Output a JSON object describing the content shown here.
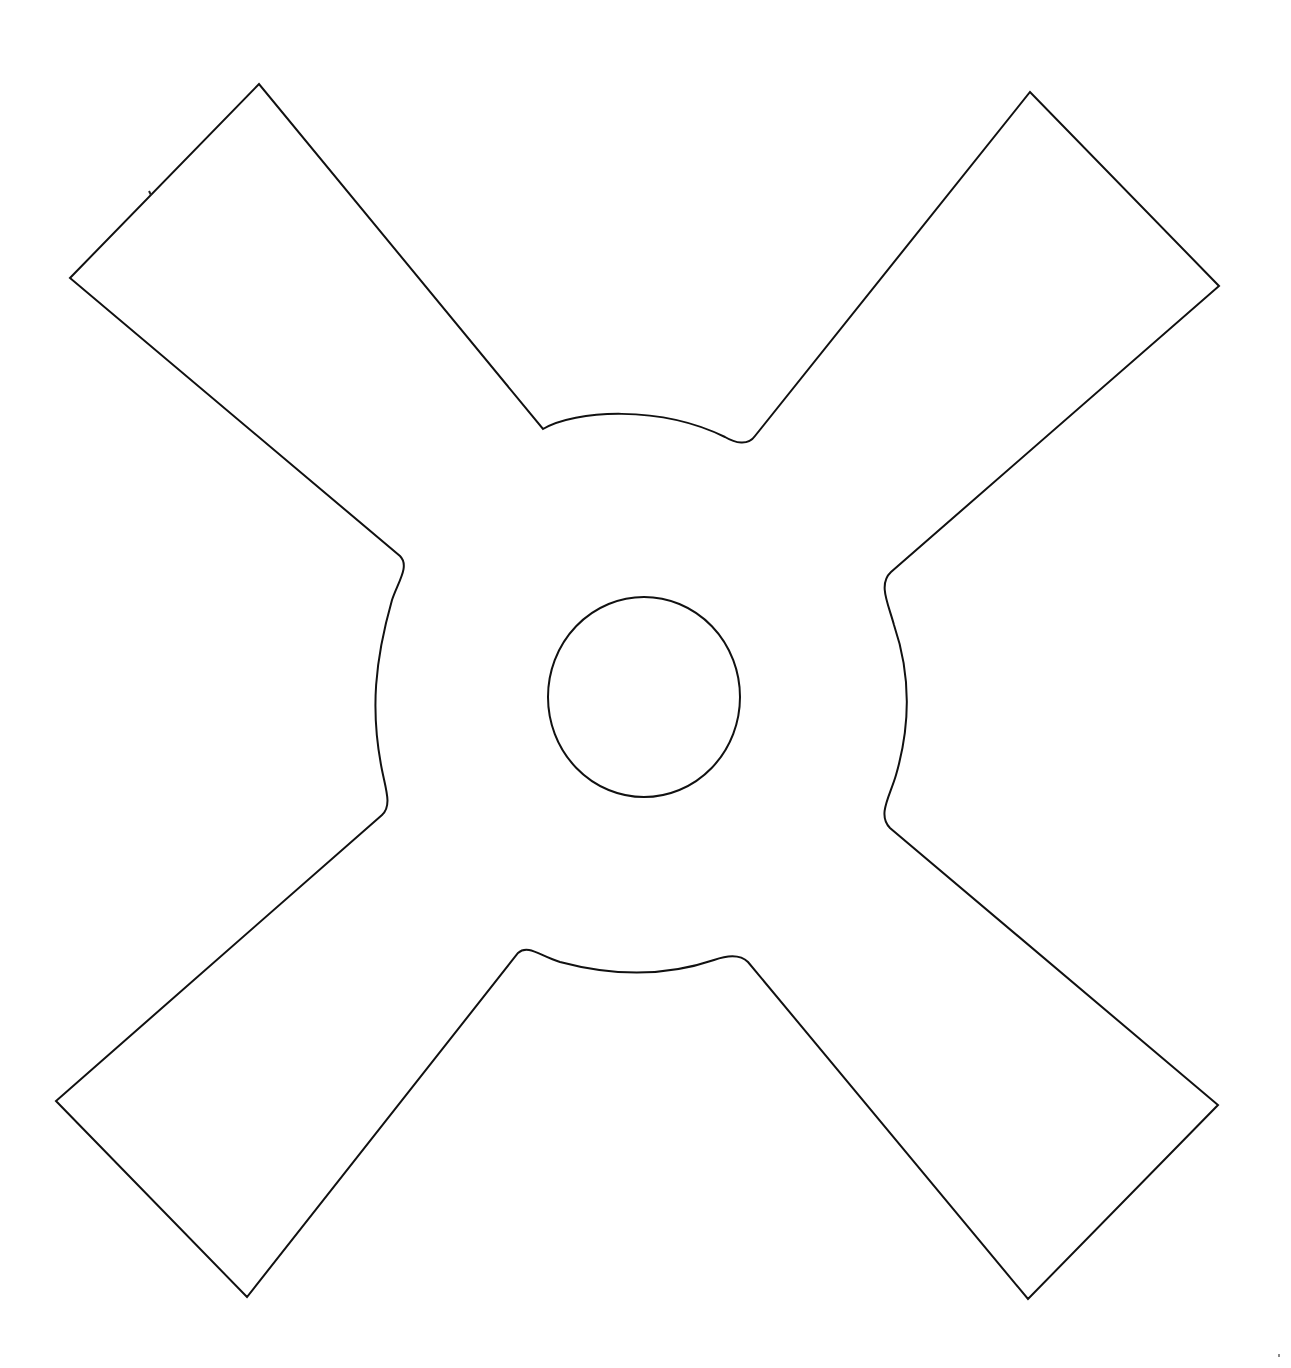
{
  "figure": {
    "stroke_color": "#111111",
    "background_color": "#ffffff",
    "shape": {
      "name": "cross-shaped outline",
      "arms": [
        {
          "name": "top-left arm",
          "outer_corners": [
            [
              259,
              84
            ],
            [
              70,
              278
            ]
          ]
        },
        {
          "name": "top-right arm",
          "outer_corners": [
            [
              1030,
              92
            ],
            [
              1219,
              286
            ]
          ]
        },
        {
          "name": "bottom-right arm",
          "outer_corners": [
            [
              1218,
              1105
            ],
            [
              1028,
              1299
            ]
          ]
        },
        {
          "name": "bottom-left arm",
          "outer_corners": [
            [
              56,
              1101
            ],
            [
              247,
              1297
            ]
          ]
        }
      ],
      "inner_junctions": {
        "top": [
          [
            543,
            429
          ],
          [
            755,
            435
          ]
        ],
        "right": [
          [
            887,
            578
          ],
          [
            884,
            825
          ]
        ],
        "bottom": [
          [
            738,
            958
          ],
          [
            522,
            949
          ]
        ],
        "left": [
          [
            386,
            810
          ],
          [
            402,
            558
          ]
        ]
      }
    },
    "center_hole": {
      "cx": 644,
      "cy": 697,
      "rx": 96,
      "ry": 100
    },
    "stray_marks": [
      {
        "x": 150,
        "y": 193
      },
      {
        "x": 1279,
        "y": 1355
      }
    ]
  }
}
